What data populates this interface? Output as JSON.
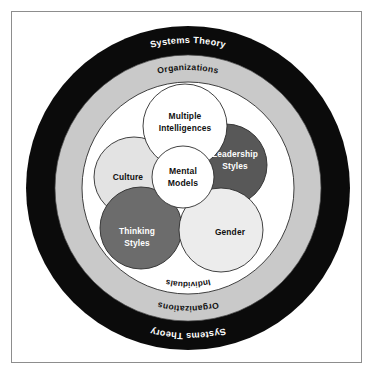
{
  "diagram": {
    "rings": [
      {
        "id": "systems-theory",
        "label_top": "Systems Theory",
        "label_bottom": "Systems Theory",
        "fill": "#0b0b0b",
        "text_color": "#ffffff"
      },
      {
        "id": "organizations",
        "label_top": "Organizations",
        "label_bottom": "Organizations",
        "fill": "#c9c9c9",
        "text_color": "#111111"
      },
      {
        "id": "individuals",
        "label_top": "Individuals",
        "label_bottom": "Individuals",
        "fill": "#ffffff",
        "text_color": "#111111"
      }
    ],
    "bubbles": [
      {
        "id": "multiple-intelligences",
        "line1": "Multiple",
        "line2": "Intelligences",
        "fill": "#ffffff",
        "text_color": "#101010"
      },
      {
        "id": "culture",
        "line1": "Culture",
        "line2": "",
        "fill": "#e3e3e3",
        "text_color": "#101010"
      },
      {
        "id": "leadership-styles",
        "line1": "Leadership",
        "line2": "Styles",
        "fill": "#585858",
        "text_color": "#ffffff"
      },
      {
        "id": "thinking-styles",
        "line1": "Thinking",
        "line2": "Styles",
        "fill": "#6c6c6c",
        "text_color": "#ffffff"
      },
      {
        "id": "gender",
        "line1": "Gender",
        "line2": "",
        "fill": "#ececec",
        "text_color": "#101010"
      },
      {
        "id": "mental-models",
        "line1": "Mental",
        "line2": "Models",
        "fill": "#ffffff",
        "text_color": "#101010"
      }
    ],
    "colors": {
      "page_background": "#ffffff",
      "frame_border": "#8d8d8d",
      "outline": "#2c2c2c"
    }
  }
}
